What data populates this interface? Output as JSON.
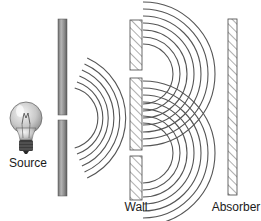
{
  "labels": {
    "source": "Source",
    "wall": "Wall",
    "absorber": "Absorber"
  },
  "diagram": {
    "type": "double-slit-experiment",
    "components": [
      {
        "id": "source",
        "icon": "light-bulb-icon",
        "label": "Source"
      },
      {
        "id": "first-barrier",
        "slits": 1
      },
      {
        "id": "wall",
        "slits": 2,
        "label": "Wall"
      },
      {
        "id": "absorber",
        "label": "Absorber"
      }
    ],
    "colors": {
      "wave": "#555555",
      "barrier": "#8a8a8a",
      "hatch": "#777777",
      "text": "#1a1a1a"
    }
  }
}
